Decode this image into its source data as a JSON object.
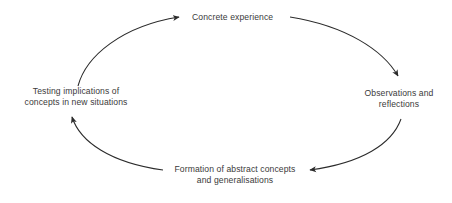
{
  "diagram": {
    "type": "cycle",
    "background_color": "#ffffff",
    "stroke_color": "#2b2b2b",
    "text_color": "#3a3a3a",
    "direction": "clockwise",
    "nodes": [
      {
        "id": "concrete-experience",
        "position": "top",
        "lines": [
          "Concrete experience"
        ]
      },
      {
        "id": "observations-reflections",
        "position": "right",
        "lines": [
          "Observations and",
          "reflections"
        ]
      },
      {
        "id": "formation-abstract",
        "position": "bottom",
        "lines": [
          "Formation of abstract concepts",
          "and generalisations"
        ]
      },
      {
        "id": "testing-implications",
        "position": "left",
        "lines": [
          "Testing implications of",
          "concepts in new situations"
        ]
      }
    ],
    "arrows": [
      {
        "id": "arrow-testing-to-concrete",
        "from": "testing-implications",
        "to": "concrete-experience"
      },
      {
        "id": "arrow-concrete-to-observations",
        "from": "concrete-experience",
        "to": "observations-reflections"
      },
      {
        "id": "arrow-observations-to-formation",
        "from": "observations-reflections",
        "to": "formation-abstract"
      },
      {
        "id": "arrow-formation-to-testing",
        "from": "formation-abstract",
        "to": "testing-implications"
      }
    ]
  }
}
